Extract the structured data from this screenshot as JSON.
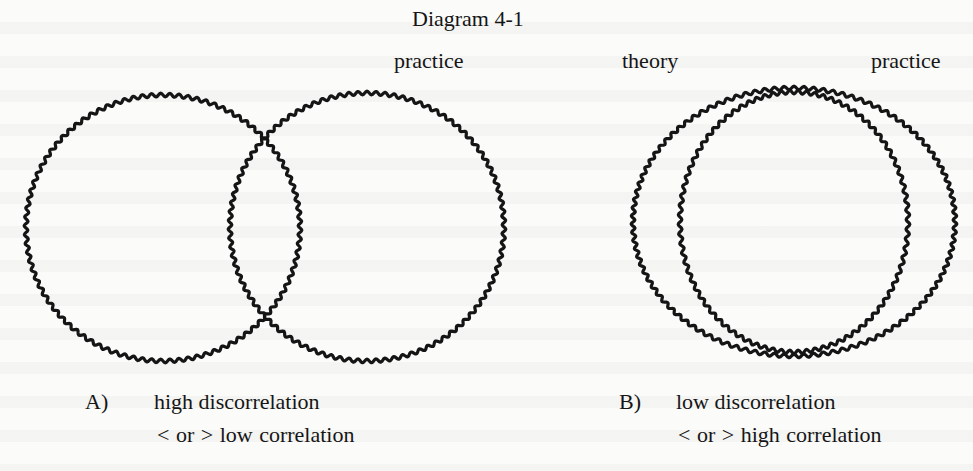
{
  "page": {
    "title": "Diagram 4-1",
    "ink_color": "#151515",
    "background_color": "#fbfbfa"
  },
  "diagram_a": {
    "id": "A",
    "top_labels": [
      {
        "text": "practice",
        "x": 394,
        "y": 50
      }
    ],
    "circles": [
      {
        "name": "theory",
        "cx": 163,
        "cy": 228,
        "rx": 137,
        "ry": 133
      },
      {
        "name": "practice",
        "cx": 367,
        "cy": 227,
        "rx": 137,
        "ry": 134
      }
    ],
    "caption": {
      "marker": "A)",
      "line1": "high discorrelation",
      "line2": "< or >  low correlation"
    }
  },
  "diagram_b": {
    "id": "B",
    "top_labels": [
      {
        "text": "theory",
        "x": 622,
        "y": 50
      },
      {
        "text": "practice",
        "x": 871,
        "y": 50
      }
    ],
    "circles": [
      {
        "name": "theory",
        "cx": 794,
        "cy": 222,
        "rx": 161,
        "ry": 134
      },
      {
        "name": "practice",
        "cx": 794,
        "cy": 222,
        "rx": 114,
        "ry": 130
      }
    ],
    "caption": {
      "marker": "B)",
      "line1": "low discorrelation",
      "line2": "< or >  high correlation"
    }
  },
  "wave": {
    "amplitude": 1.8,
    "wavelength": 9,
    "stroke_width": 3.2
  }
}
